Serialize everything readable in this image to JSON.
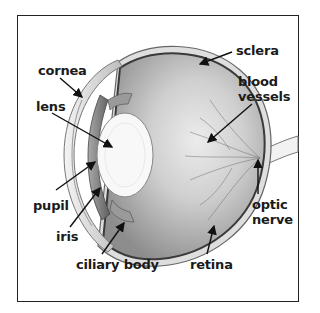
{
  "diagram": {
    "type": "anatomical-cross-section",
    "labels": [
      {
        "id": "cornea",
        "text": "cornea",
        "x": 38,
        "y": 64
      },
      {
        "id": "lens",
        "text": "lens",
        "x": 36,
        "y": 100
      },
      {
        "id": "sclera",
        "text": "sclera",
        "x": 236,
        "y": 44
      },
      {
        "id": "blood-vessels-1",
        "text": "blood",
        "x": 238,
        "y": 75
      },
      {
        "id": "blood-vessels-2",
        "text": "vessels",
        "x": 238,
        "y": 90
      },
      {
        "id": "pupil",
        "text": "pupil",
        "x": 33,
        "y": 199
      },
      {
        "id": "iris",
        "text": "iris",
        "x": 56,
        "y": 230
      },
      {
        "id": "ciliary-body",
        "text": "ciliary body",
        "x": 76,
        "y": 258
      },
      {
        "id": "retina",
        "text": "retina",
        "x": 190,
        "y": 258
      },
      {
        "id": "optic-nerve-1",
        "text": "optic",
        "x": 252,
        "y": 198
      },
      {
        "id": "optic-nerve-2",
        "text": "nerve",
        "x": 252,
        "y": 213
      }
    ],
    "colors": {
      "frame": "#222222",
      "text": "#1a1a1a",
      "sclera_outline": "#555555",
      "vitreous_dark": "#8a8a8a",
      "vitreous_light": "#e4e4e4",
      "lens": "#f7f7f7"
    }
  }
}
